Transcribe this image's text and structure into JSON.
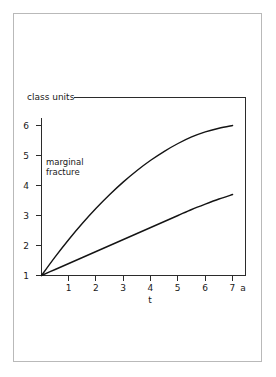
{
  "chart_data": {
    "type": "line",
    "title": "class units",
    "xlabel": "t",
    "ylabel": "",
    "x_unit": "a",
    "xlim": [
      0,
      7.3
    ],
    "ylim": [
      1,
      6.5
    ],
    "grid": false,
    "legend": false,
    "x_ticks": [
      "1",
      "2",
      "3",
      "4",
      "5",
      "6",
      "7"
    ],
    "x_tick_values": [
      1,
      2,
      3,
      4,
      5,
      6,
      7
    ],
    "y_ticks": [
      "1",
      "2",
      "3",
      "4",
      "5",
      "6"
    ],
    "y_tick_values": [
      1,
      2,
      3,
      4,
      5,
      6
    ],
    "annotations": [
      {
        "name": "marginal-fracture",
        "line1": "marginal",
        "line2": "fracture",
        "x": 0.15,
        "y": 4.6
      }
    ],
    "series": [
      {
        "name": "upper-curve",
        "color": "#141414",
        "x": [
          0,
          0.5,
          1,
          1.5,
          2,
          2.5,
          3,
          3.5,
          4,
          4.5,
          5,
          5.5,
          6,
          6.5,
          7
        ],
        "values": [
          1,
          1.62,
          2.2,
          2.74,
          3.24,
          3.7,
          4.12,
          4.5,
          4.84,
          5.14,
          5.4,
          5.62,
          5.79,
          5.91,
          6.0
        ]
      },
      {
        "name": "lower-curve",
        "color": "#141414",
        "x": [
          0,
          0.5,
          1,
          1.5,
          2,
          2.5,
          3,
          3.5,
          4,
          4.5,
          5,
          5.5,
          6,
          6.5,
          7
        ],
        "values": [
          1,
          1.2,
          1.4,
          1.6,
          1.8,
          2.0,
          2.2,
          2.4,
          2.6,
          2.8,
          3.0,
          3.2,
          3.38,
          3.55,
          3.7
        ]
      }
    ]
  },
  "colors": {
    "page_frame": "#b9b9b9",
    "axis": "#2b2b2b",
    "curve": "#141414",
    "background": "#ffffff"
  }
}
